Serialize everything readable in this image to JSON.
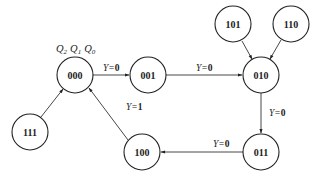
{
  "diagram": {
    "type": "state-transition-diagram",
    "state_header": {
      "text": "Q2 Q1 Q0",
      "parts": [
        "Q",
        "2",
        "Q",
        "1",
        "Q",
        "0"
      ]
    },
    "states": [
      {
        "id": "000",
        "label": "000",
        "x": 75,
        "y": 75
      },
      {
        "id": "001",
        "label": "001",
        "x": 148,
        "y": 75
      },
      {
        "id": "010",
        "label": "010",
        "x": 261,
        "y": 75
      },
      {
        "id": "101",
        "label": "101",
        "x": 233,
        "y": 24
      },
      {
        "id": "110",
        "label": "110",
        "x": 291,
        "y": 24
      },
      {
        "id": "111",
        "label": "111",
        "x": 30,
        "y": 132
      },
      {
        "id": "011",
        "label": "011",
        "x": 261,
        "y": 152
      },
      {
        "id": "100",
        "label": "100",
        "x": 142,
        "y": 152
      }
    ],
    "transitions": [
      {
        "from": "000",
        "to": "001",
        "label": "Y=0",
        "var": "Y=",
        "val": "0"
      },
      {
        "from": "001",
        "to": "010",
        "label": "Y=0",
        "var": "Y=",
        "val": "0"
      },
      {
        "from": "101",
        "to": "010",
        "label": ""
      },
      {
        "from": "110",
        "to": "010",
        "label": ""
      },
      {
        "from": "010",
        "to": "011",
        "label": "Y=0",
        "var": "Y=",
        "val": "0"
      },
      {
        "from": "011",
        "to": "100",
        "label": "Y=0",
        "var": "Y=",
        "val": "0"
      },
      {
        "from": "100",
        "to": "000",
        "label": "Y=1",
        "var": "Y=",
        "val": "1"
      },
      {
        "from": "111",
        "to": "000",
        "label": ""
      }
    ]
  }
}
